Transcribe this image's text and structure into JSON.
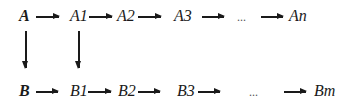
{
  "diagram": {
    "type": "flow-chains",
    "top_row": {
      "nodes": [
        {
          "id": "A",
          "label": "A",
          "bold": true
        },
        {
          "id": "A1",
          "label": "A1"
        },
        {
          "id": "A2",
          "label": "A2"
        },
        {
          "id": "A3",
          "label": "A3"
        },
        {
          "id": "ellipsis",
          "label": "..."
        },
        {
          "id": "An",
          "label": "An"
        }
      ]
    },
    "bottom_row": {
      "nodes": [
        {
          "id": "B",
          "label": "B",
          "bold": true
        },
        {
          "id": "B1",
          "label": "B1"
        },
        {
          "id": "B2",
          "label": "B2"
        },
        {
          "id": "B3",
          "label": "B3"
        },
        {
          "id": "ellipsis",
          "label": "..."
        },
        {
          "id": "Bm",
          "label": "Bm"
        }
      ]
    },
    "edges": [
      {
        "from": "A",
        "to": "A1"
      },
      {
        "from": "A1",
        "to": "A2"
      },
      {
        "from": "A2",
        "to": "A3"
      },
      {
        "from": "A3",
        "to": "..."
      },
      {
        "from": "...",
        "to": "An"
      },
      {
        "from": "B",
        "to": "B1"
      },
      {
        "from": "B1",
        "to": "B2"
      },
      {
        "from": "B2",
        "to": "B3"
      },
      {
        "from": "B3",
        "to": "..."
      },
      {
        "from": "...",
        "to": "Bm"
      },
      {
        "from": "A",
        "to": "B"
      },
      {
        "from": "A1",
        "to": "B1"
      }
    ]
  }
}
